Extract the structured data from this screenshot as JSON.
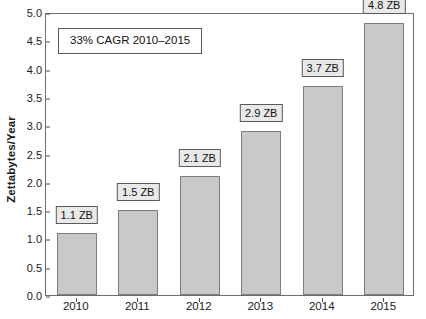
{
  "chart_data": {
    "type": "bar",
    "title": "",
    "xlabel": "",
    "ylabel": "Zettabytes/Year",
    "categories": [
      "2010",
      "2011",
      "2012",
      "2013",
      "2014",
      "2015"
    ],
    "values": [
      1.1,
      1.5,
      2.1,
      2.9,
      3.7,
      4.8
    ],
    "data_labels": [
      "1.1 ZB",
      "1.5 ZB",
      "2.1 ZB",
      "2.9 ZB",
      "3.7 ZB",
      "4.8 ZB"
    ],
    "ylim": [
      0.0,
      5.0
    ],
    "ytick_values": [
      0.0,
      0.5,
      1.0,
      1.5,
      2.0,
      2.5,
      3.0,
      3.5,
      4.0,
      4.5,
      5.0
    ],
    "ytick_labels": [
      "0.0",
      "0.5",
      "1.0",
      "1.5",
      "2.0",
      "2.5",
      "3.0",
      "3.5",
      "4.0",
      "4.5",
      "5.0"
    ],
    "grid": false,
    "legend": false,
    "annotations": [
      {
        "text": "33% CAGR 2010–2015",
        "position": "top-left-inside-plot"
      }
    ],
    "colors": {
      "bar_fill": "#c9c9c9",
      "bar_edge": "#7d7d7d",
      "frame": "#6e6e6e",
      "label_box_fill": "#e9e9e9",
      "label_box_edge": "#5a5a5a",
      "text": "#111111",
      "background": "#ffffff"
    }
  },
  "axes": {
    "y_title": "Zettabytes/Year"
  },
  "annotation": {
    "cagr_text": "33% CAGR 2010–2015"
  }
}
